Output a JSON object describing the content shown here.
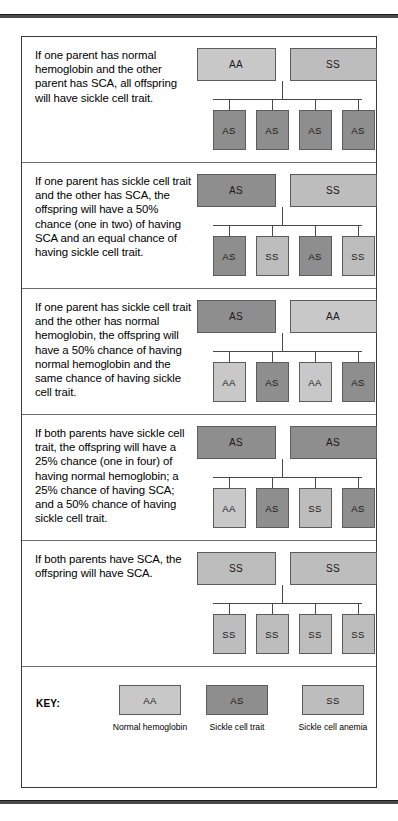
{
  "figure": {
    "colors": {
      "normal_hemoglobin": "#c8c8c8",
      "sickle_cell_trait": "#8e8e8e",
      "sickle_cell_anemia": "#bdbdbd",
      "line": "#4a4a4a",
      "border": "#5c5c5c"
    },
    "scenarios": [
      {
        "text": "If one parent has normal hemoglobin and the other parent has SCA, all offspring will have sickle cell trait.",
        "parents": [
          "AA",
          "SS"
        ],
        "children": [
          "AS",
          "AS",
          "AS",
          "AS"
        ]
      },
      {
        "text": "If one parent has sickle cell trait and the other has SCA, the offspring will have a 50% chance (one in two) of having SCA and an equal chance of having sickle cell trait.",
        "parents": [
          "AS",
          "SS"
        ],
        "children": [
          "AS",
          "SS",
          "AS",
          "SS"
        ]
      },
      {
        "text": "If one parent has sickle cell trait and the other has normal hemoglobin, the offspring will have a 50% chance of having normal hemoglobin and the same chance of having sickle cell trait.",
        "parents": [
          "AS",
          "AA"
        ],
        "children": [
          "AA",
          "AS",
          "AA",
          "AS"
        ]
      },
      {
        "text": "If both parents have sickle cell trait, the offspring will have a 25% chance (one in four) of having normal hemoglobin; a 25% chance of having SCA; and a 50% chance of having sickle cell trait.",
        "parents": [
          "AS",
          "AS"
        ],
        "children": [
          "AA",
          "AS",
          "SS",
          "AS"
        ]
      },
      {
        "text": "If both parents have SCA, the offspring will have SCA.",
        "parents": [
          "SS",
          "SS"
        ],
        "children": [
          "SS",
          "SS",
          "SS",
          "SS"
        ]
      }
    ],
    "key": {
      "label": "KEY:",
      "items": [
        {
          "genotype": "AA",
          "caption": "Normal hemoglobin"
        },
        {
          "genotype": "AS",
          "caption": "Sickle cell trait"
        },
        {
          "genotype": "SS",
          "caption": "Sickle cell anemia"
        }
      ]
    }
  }
}
